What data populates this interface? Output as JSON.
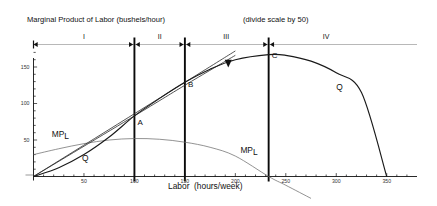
{
  "header": {
    "line1": "Quantity (bushels/week)",
    "line2": "Marginal Product of Labor (bushels/hour)",
    "note": "(divide scale by 50)"
  },
  "axes": {
    "x_title": "Labor  (hours/week)",
    "x_ticks": [
      50,
      100,
      150,
      200,
      250,
      300,
      350
    ],
    "x_tick_labels": [
      "50",
      "100",
      "150",
      "200",
      "250",
      "300",
      "350"
    ],
    "x_min": 0,
    "x_max": 380,
    "y_ticks": [
      50,
      100,
      150
    ],
    "y_tick_labels": [
      "50",
      "100",
      "150"
    ],
    "y_min": -12,
    "y_max": 178,
    "grid": false
  },
  "regions": {
    "labels": [
      "I",
      "II",
      "III",
      "IV"
    ],
    "boundaries": [
      100,
      150,
      233
    ],
    "label_positions": [
      50,
      125,
      191,
      290
    ]
  },
  "points": [
    {
      "label": "A",
      "x": 100,
      "y": 83
    },
    {
      "label": "B",
      "x": 150,
      "y": 129
    },
    {
      "label": "C",
      "x": 233,
      "y": 167
    }
  ],
  "curve_labels": [
    {
      "label": "MPL",
      "sub": "L",
      "x": 18,
      "y": 55
    },
    {
      "label": "Q",
      "x": 48,
      "y": 22
    },
    {
      "label": "MPL",
      "sub": "L",
      "x": 205,
      "y": 34
    },
    {
      "label": "Q",
      "x": 300,
      "y": 120
    }
  ],
  "markers": [
    {
      "shape": "triangle-down",
      "x": 193,
      "y": 155
    }
  ],
  "chart_data": {
    "type": "line",
    "subtitle": "(divide scale by 50)",
    "xlabel": "Labor  (hours/week)",
    "ylabel": "Quantity (bushels/week)",
    "xlim": [
      0,
      380
    ],
    "ylim": [
      -12,
      178
    ],
    "xticks": [
      50,
      100,
      150,
      200,
      250,
      300,
      350
    ],
    "yticks": [
      50,
      100,
      150
    ],
    "grid": false,
    "legend": "inline-curve-labels",
    "series": [
      {
        "name": "Q",
        "description": "Total product curve: rises, inflects at 100, peaks at 233, falls to zero at 350",
        "x": [
          0,
          25,
          50,
          75,
          100,
          125,
          150,
          175,
          200,
          233,
          250,
          275,
          300,
          325,
          350
        ],
        "y": [
          0,
          12,
          30,
          54,
          83,
          107,
          129,
          147,
          160,
          167,
          166,
          158,
          142,
          115,
          0
        ]
      },
      {
        "name": "MPL",
        "description": "Marginal product of labor (scaled x50): rises to max near 100, falls to zero at 233",
        "x": [
          0,
          25,
          50,
          75,
          100,
          125,
          150,
          175,
          200,
          233,
          250,
          275
        ],
        "y": [
          30,
          38,
          45,
          50,
          52,
          51,
          47,
          40,
          28,
          0,
          -12,
          -30
        ]
      },
      {
        "name": "ray-OA",
        "description": "Ray from origin through point A (average product), tangent reference",
        "x": [
          0,
          100,
          150,
          200
        ],
        "y": [
          0,
          83,
          125,
          166
        ]
      },
      {
        "name": "ray-OB",
        "description": "Ray from origin through point B, tangent to Q at B",
        "x": [
          0,
          150,
          200
        ],
        "y": [
          0,
          129,
          172
        ]
      }
    ],
    "annotations": [
      {
        "text": "A",
        "x": 100,
        "y": 83
      },
      {
        "text": "B",
        "x": 150,
        "y": 129
      },
      {
        "text": "C",
        "x": 233,
        "y": 167
      },
      {
        "text": "I",
        "x": 50,
        "y": 178
      },
      {
        "text": "II",
        "x": 125,
        "y": 178
      },
      {
        "text": "III",
        "x": 191,
        "y": 178
      },
      {
        "text": "IV",
        "x": 290,
        "y": 178
      }
    ]
  }
}
